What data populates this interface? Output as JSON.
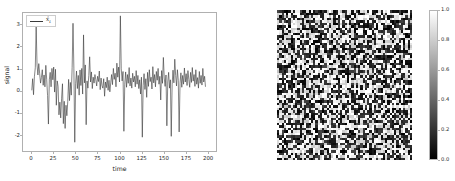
{
  "figure": {
    "background_color": "#ffffff",
    "width": 455,
    "height": 181,
    "panels": 2
  },
  "chart_data": [
    {
      "type": "line",
      "title": "",
      "xlabel": "time",
      "ylabel": "signal",
      "xlim": [
        -10,
        210
      ],
      "ylim": [
        -2.75,
        3.55
      ],
      "xticks": [
        0,
        25,
        50,
        75,
        100,
        125,
        150,
        175,
        200
      ],
      "xticklabels": [
        "0",
        "25",
        "50",
        "75",
        "100",
        "125",
        "150",
        "175",
        "200"
      ],
      "yticks": [
        -2,
        -1,
        0,
        1,
        2,
        3
      ],
      "yticklabels": [
        "-2",
        "-1",
        "0",
        "1",
        "2",
        "3"
      ],
      "grid": false,
      "legend": {
        "position": "upper left",
        "entries": [
          {
            "label": "x̂ₜ",
            "label_plain": "x_t",
            "color": "#3a3a3a",
            "linewidth": 0.9
          }
        ]
      },
      "series": [
        {
          "name": "x̂ₜ",
          "color": "#3a3a3a",
          "x": [
            0,
            1,
            2,
            3,
            4,
            5,
            6,
            7,
            8,
            9,
            10,
            11,
            12,
            13,
            14,
            15,
            16,
            17,
            18,
            19,
            20,
            21,
            22,
            23,
            24,
            25,
            26,
            27,
            28,
            29,
            30,
            31,
            32,
            33,
            34,
            35,
            36,
            37,
            38,
            39,
            40,
            41,
            42,
            43,
            44,
            45,
            46,
            47,
            48,
            49,
            50,
            51,
            52,
            53,
            54,
            55,
            56,
            57,
            58,
            59,
            60,
            61,
            62,
            63,
            64,
            65,
            66,
            67,
            68,
            69,
            70,
            71,
            72,
            73,
            74,
            75,
            76,
            77,
            78,
            79,
            80,
            81,
            82,
            83,
            84,
            85,
            86,
            87,
            88,
            89,
            90,
            91,
            92,
            93,
            94,
            95,
            96,
            97,
            98,
            99,
            100,
            101,
            102,
            103,
            104,
            105,
            106,
            107,
            108,
            109,
            110,
            111,
            112,
            113,
            114,
            115,
            116,
            117,
            118,
            119,
            120,
            121,
            122,
            123,
            124,
            125,
            126,
            127,
            128,
            129,
            130,
            131,
            132,
            133,
            134,
            135,
            136,
            137,
            138,
            139,
            140,
            141,
            142,
            143,
            144,
            145,
            146,
            147,
            148,
            149,
            150,
            151,
            152,
            153,
            154,
            155,
            156,
            157,
            158,
            159,
            160,
            161,
            162,
            163,
            164,
            165,
            166,
            167,
            168,
            169,
            170,
            171,
            172,
            173,
            174,
            175,
            176,
            177,
            178,
            179,
            180,
            181,
            182,
            183,
            184,
            185,
            186,
            187,
            188,
            189,
            190,
            191,
            192,
            193,
            194,
            195,
            196,
            197,
            198,
            199
          ],
          "values": [
            0.02,
            0.55,
            -0.18,
            0.64,
            1.05,
            2.92,
            1.18,
            0.72,
            1.24,
            0.78,
            0.35,
            0.6,
            0.96,
            0.25,
            0.72,
            0.18,
            1.16,
            0.52,
            -0.22,
            -1.52,
            0.5,
            0.84,
            0.18,
            1.02,
            0.5,
            1.08,
            -0.06,
            0.98,
            -0.66,
            0.45,
            0.2,
            -1.1,
            -0.52,
            -1.24,
            -0.34,
            0.32,
            -1.5,
            -0.48,
            -1.72,
            -0.66,
            -1.14,
            -0.5,
            0.52,
            -0.45,
            0.38,
            -0.2,
            1.05,
            3.08,
            1.0,
            -2.35,
            0.32,
            0.9,
            0.1,
            0.7,
            -0.2,
            0.95,
            0.24,
            1.02,
            -0.15,
            2.55,
            0.36,
            1.18,
            -1.55,
            0.45,
            0.12,
            0.7,
            1.55,
            0.4,
            0.86,
            0.1,
            0.62,
            0.35,
            0.74,
            0.5,
            0.22,
            0.66,
            0.42,
            0.9,
            0.05,
            0.58,
            0.24,
            0.12,
            0.55,
            -0.25,
            0.4,
            0.14,
            0.62,
            0.02,
            0.48,
            -0.05,
            0.36,
            0.74,
            0.28,
            1.02,
            0.52,
            0.8,
            0.18,
            1.26,
            0.62,
            1.08,
            0.4,
            3.42,
            1.0,
            0.45,
            0.88,
            -1.85,
            0.3,
            0.86,
            0.16,
            0.74,
            0.34,
            1.06,
            0.22,
            0.58,
            0.12,
            0.8,
            0.4,
            0.66,
            0.18,
            0.92,
            0.3,
            0.7,
            0.1,
            0.5,
            -0.15,
            0.62,
            -2.12,
            0.25,
            0.78,
            0.06,
            0.55,
            -0.3,
            0.84,
            0.2,
            0.96,
            0.42,
            0.62,
            0.08,
            1.1,
            0.36,
            0.74,
            0.18,
            0.88,
            0.48,
            1.02,
            0.3,
            0.66,
            -0.42,
            0.92,
            0.34,
            1.52,
            0.58,
            0.2,
            0.72,
            -1.6,
            0.4,
            0.84,
            0.12,
            0.5,
            -2.08,
            0.28,
            0.94,
            0.36,
            1.44,
            0.7,
            0.22,
            0.96,
            0.48,
            -1.88,
            0.34,
            0.82,
            0.16,
            0.7,
            0.3,
            1.04,
            0.4,
            0.78,
            0.24,
            0.92,
            0.52,
            0.16,
            0.84,
            0.38,
            1.06,
            0.44,
            0.74,
            0.2,
            0.96,
            0.3,
            0.6,
            0.12,
            0.88,
            0.34,
            0.7,
            0.26,
            1.02,
            0.4,
            0.66,
            0.18
          ]
        }
      ]
    },
    {
      "type": "heatmap",
      "title": "",
      "xlabel": "",
      "ylabel": "",
      "colormap": "gray",
      "grid_size": [
        60,
        60
      ],
      "data_description": "uniform random noise, 60 by 60 grid",
      "vmin": 0.0,
      "vmax": 1.0,
      "colorbar": {
        "orientation": "vertical",
        "position": "right",
        "ticks": [
          1.0,
          0.8,
          0.6,
          0.4,
          0.2,
          0.0
        ],
        "ticklabels": [
          "1.0",
          "0.8",
          "0.6",
          "0.4",
          "0.2",
          "0.0"
        ],
        "gradient_top_color": "#ffffff",
        "gradient_bottom_color": "#000000"
      }
    }
  ],
  "left_plot": {
    "xlabel": "time",
    "ylabel": "signal",
    "xticklabels": [
      "0",
      "25",
      "50",
      "75",
      "100",
      "125",
      "150",
      "175",
      "200"
    ],
    "yticklabels": [
      "3",
      "2",
      "1",
      "0",
      "-1",
      "-2"
    ],
    "legend_label": "x̂",
    "legend_subscript": "t",
    "line_color": "#3a3a3a"
  },
  "right_plot": {
    "colorbar_ticklabels": [
      "1.0",
      "0.8",
      "0.6",
      "0.4",
      "0.2",
      "0.0"
    ],
    "colormap_name": "gray"
  }
}
